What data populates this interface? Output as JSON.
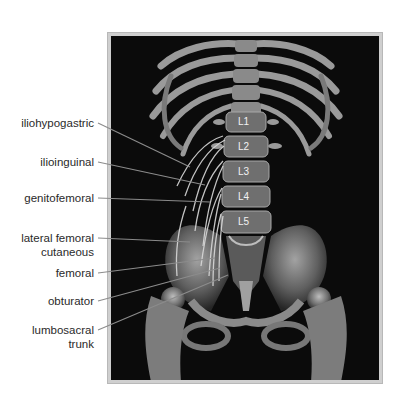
{
  "figure": {
    "background_color": "#0b0b0b",
    "frame_color": "#cfcfcf",
    "leader_color": "#8a8a8a",
    "nerve_color": "#d8d8d8"
  },
  "nerve_labels": [
    {
      "id": "iliohypogastric",
      "lines": [
        "iliohypogastric"
      ]
    },
    {
      "id": "ilioinguinal",
      "lines": [
        "ilioinguinal"
      ]
    },
    {
      "id": "genitofemoral",
      "lines": [
        "genitofemoral"
      ]
    },
    {
      "id": "lateral-femoral-cutaneous",
      "lines": [
        "lateral femoral",
        "cutaneous"
      ]
    },
    {
      "id": "femoral",
      "lines": [
        "femoral"
      ]
    },
    {
      "id": "obturator",
      "lines": [
        "obturator"
      ]
    },
    {
      "id": "lumbosacral-trunk",
      "lines": [
        "lumbosacral",
        "trunk"
      ]
    }
  ],
  "vertebra_labels": [
    "L1",
    "L2",
    "L3",
    "L4",
    "L5"
  ]
}
